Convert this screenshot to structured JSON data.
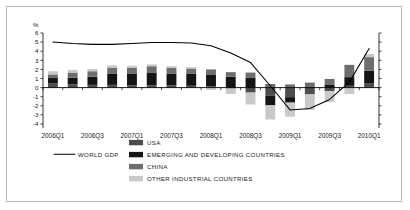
{
  "chart_data": {
    "type": "bar",
    "title": "",
    "subtitle": "",
    "xlabel": "",
    "ylabel": "%",
    "ylim": [
      -4,
      6
    ],
    "y_ticks": [
      "6",
      "5",
      "4",
      "3",
      "2",
      "1",
      "0",
      "-1",
      "-2",
      "-3",
      "-4"
    ],
    "grid": false,
    "legend_position": "bottom",
    "stacked": true,
    "x": [
      "2006Q1",
      "2006Q2",
      "2006Q3",
      "2006Q4",
      "2007Q1",
      "2007Q2",
      "2007Q3",
      "2007Q4",
      "2008Q1",
      "2008Q2",
      "2008Q3",
      "2008Q4",
      "2009Q1",
      "2009Q2",
      "2009Q3",
      "2009Q4",
      "2010Q1"
    ],
    "x_tick_labels": [
      "2006Q1",
      "2006Q3",
      "2007Q1",
      "2007Q3",
      "2008Q1",
      "2008Q3",
      "2009Q1",
      "2009Q3",
      "2010Q1"
    ],
    "x_tick_indices": [
      0,
      2,
      4,
      6,
      8,
      10,
      12,
      14,
      16
    ],
    "series": [
      {
        "name": "USA",
        "color": "#4d4d4d",
        "values": [
          0.45,
          0.35,
          0.3,
          0.3,
          0.25,
          0.25,
          0.25,
          0.2,
          0.15,
          -0.1,
          -0.55,
          -0.9,
          -1.05,
          -0.75,
          -0.4,
          0.2,
          0.5
        ]
      },
      {
        "name": "EMERGING AND DEVELOPING COUNTRIES",
        "color": "#141414",
        "values": [
          0.6,
          0.75,
          0.9,
          1.2,
          1.25,
          1.35,
          1.3,
          1.35,
          1.3,
          1.2,
          1.05,
          -1.05,
          -0.6,
          0.05,
          0.35,
          0.95,
          1.35
        ]
      },
      {
        "name": "CHINA",
        "color": "#6e6e6e",
        "values": [
          0.4,
          0.55,
          0.6,
          0.7,
          0.7,
          0.75,
          0.6,
          0.55,
          0.55,
          0.5,
          0.6,
          0.4,
          0.35,
          0.5,
          0.6,
          1.35,
          1.5
        ]
      },
      {
        "name": "OTHER INDUSTRIAL COUNTRIES",
        "color": "#c9c9c9",
        "values": [
          0.35,
          0.3,
          0.25,
          0.25,
          0.2,
          0.2,
          0.2,
          0.15,
          -0.25,
          -0.6,
          -1.3,
          -1.55,
          -1.55,
          -1.7,
          -1.2,
          -0.7,
          0.35
        ]
      }
    ],
    "line_series": {
      "name": "WORLD GDP",
      "color": "#000000",
      "values": [
        5.0,
        4.85,
        4.75,
        4.75,
        4.85,
        4.95,
        4.95,
        4.9,
        4.6,
        3.8,
        2.75,
        0.2,
        -2.45,
        -2.3,
        -1.3,
        0.6,
        4.3
      ]
    }
  },
  "legend": {
    "line_entry": "WORLD GDP",
    "entries": [
      {
        "label": "USA",
        "swatch": "usa-swatch"
      },
      {
        "label": "EMERGING AND DEVELOPING COUNTRIES",
        "swatch": "emerging-swatch"
      },
      {
        "label": "CHINA",
        "swatch": "china-swatch"
      },
      {
        "label": "OTHER INDUSTRIAL COUNTRIES",
        "swatch": "other-industrial-swatch"
      }
    ]
  },
  "axis": {
    "y_unit": "%"
  }
}
